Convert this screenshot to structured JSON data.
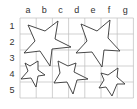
{
  "grid": {
    "columns": [
      "a",
      "b",
      "c",
      "d",
      "e",
      "f",
      "g"
    ],
    "rows": [
      "1",
      "2",
      "3",
      "4",
      "5"
    ],
    "origin": {
      "x": 20,
      "y": 18
    },
    "cell_width": 16.2,
    "cell_height": 16,
    "line_color": "#bdbdbd"
  },
  "stars": [
    {
      "name": "large-star-top-left",
      "points": "28,25 45,31 58,21 55,39 71,47 52,49 50,66 40,51 24,53 35,41"
    },
    {
      "name": "large-star-top-right",
      "points": "81,24 97,31 110,20 108,38 120,51 104,50 102,67 92,52 76,53 87,41"
    },
    {
      "name": "small-star-left",
      "points": "25,63 30,66 38,61 38,70 45,75 38,76 36,87 31,78 21,79 28,71"
    },
    {
      "name": "medium-star-middle",
      "points": "58,61 68,66 76,63 74,72 88,79 77,80 73,94 67,82 54,83 60,73"
    },
    {
      "name": "small-star-right",
      "points": "101,73 108,75 118,68 117,77 125,84 117,84 112,96 106,87 99,88 104,80"
    }
  ],
  "stroke_color": "#333333"
}
